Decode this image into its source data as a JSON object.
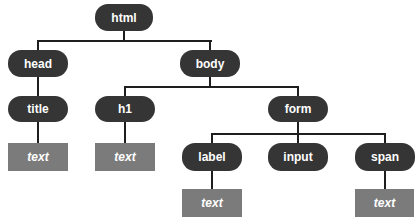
{
  "diagram": {
    "type": "dom-tree",
    "colors": {
      "element_node": "#353535",
      "text_node": "#7b7b7b",
      "node_label": "#ffffff",
      "connector": "#1e1e1e",
      "background": "#ffffff"
    },
    "nodes": {
      "html": {
        "label": "html",
        "kind": "element"
      },
      "head": {
        "label": "head",
        "kind": "element"
      },
      "body": {
        "label": "body",
        "kind": "element"
      },
      "title": {
        "label": "title",
        "kind": "element"
      },
      "h1": {
        "label": "h1",
        "kind": "element"
      },
      "form": {
        "label": "form",
        "kind": "element"
      },
      "label": {
        "label": "label",
        "kind": "element"
      },
      "input": {
        "label": "input",
        "kind": "element"
      },
      "span": {
        "label": "span",
        "kind": "element"
      },
      "title_text": {
        "label": "text",
        "kind": "text"
      },
      "h1_text": {
        "label": "text",
        "kind": "text"
      },
      "label_text": {
        "label": "text",
        "kind": "text"
      },
      "span_text": {
        "label": "text",
        "kind": "text"
      }
    },
    "edges": [
      [
        "html",
        "head"
      ],
      [
        "html",
        "body"
      ],
      [
        "head",
        "title"
      ],
      [
        "title",
        "title_text"
      ],
      [
        "body",
        "h1"
      ],
      [
        "body",
        "form"
      ],
      [
        "h1",
        "h1_text"
      ],
      [
        "form",
        "label"
      ],
      [
        "form",
        "input"
      ],
      [
        "form",
        "span"
      ],
      [
        "label",
        "label_text"
      ],
      [
        "span",
        "span_text"
      ]
    ]
  }
}
